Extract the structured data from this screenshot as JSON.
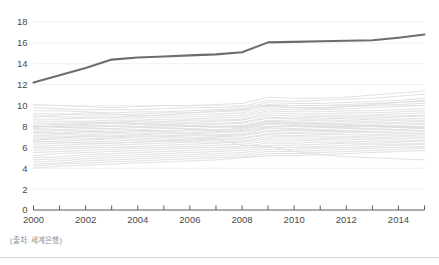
{
  "caption": {
    "source_text": "(출처: 세계은행)"
  },
  "colors": {
    "highlight_line": "#6d6d6d",
    "background_lines": "#dcdcdc",
    "gridline": "#f0f0f0",
    "axis": "#5a5a5a",
    "tick_text": "#4a4a4a",
    "caption_text": "#8a8a8a",
    "rule": "#d4d4d4",
    "page_background": "#ffffff"
  },
  "chart_data": {
    "type": "line",
    "title": "",
    "subtitle": "",
    "xlabel": "",
    "ylabel": "",
    "xlim": [
      2000,
      2015
    ],
    "ylim": [
      0,
      18
    ],
    "grid": true,
    "legend_position": "none",
    "x": [
      2000,
      2001,
      2002,
      2003,
      2004,
      2005,
      2006,
      2007,
      2008,
      2009,
      2010,
      2011,
      2012,
      2013,
      2014,
      2015
    ],
    "x_tick_labels": [
      "2000",
      "2002",
      "2004",
      "2006",
      "2008",
      "2010",
      "2012",
      "2014"
    ],
    "x_tick_values": [
      2000,
      2002,
      2004,
      2006,
      2008,
      2010,
      2012,
      2014
    ],
    "x_minor_tick_values": [
      2001,
      2003,
      2005,
      2007,
      2009,
      2011,
      2013,
      2015
    ],
    "y_tick_labels": [
      "0",
      "2",
      "4",
      "6",
      "8",
      "10",
      "12",
      "14",
      "16",
      "18"
    ],
    "y_tick_values": [
      0,
      2,
      4,
      6,
      8,
      10,
      12,
      14,
      16,
      18
    ],
    "series": [
      {
        "name": "highlighted",
        "emphasis": "high",
        "color": "#6d6d6d",
        "width": 2.1,
        "values": [
          12.2,
          12.9,
          13.6,
          14.4,
          14.6,
          14.7,
          14.8,
          14.9,
          15.1,
          16.05,
          16.1,
          16.15,
          16.2,
          16.25,
          16.5,
          16.8
        ]
      },
      {
        "name": "bg-01",
        "emphasis": "low",
        "values": [
          10.1,
          10.0,
          9.9,
          9.8,
          9.9,
          10.0,
          10.0,
          10.1,
          10.2,
          10.8,
          10.7,
          10.7,
          10.8,
          11.0,
          11.2,
          11.4
        ]
      },
      {
        "name": "bg-02",
        "emphasis": "low",
        "values": [
          9.8,
          9.7,
          9.6,
          9.6,
          9.6,
          9.7,
          9.8,
          9.8,
          9.9,
          10.5,
          10.4,
          10.5,
          10.6,
          10.7,
          10.9,
          11.1
        ]
      },
      {
        "name": "bg-03",
        "emphasis": "low",
        "values": [
          9.5,
          9.5,
          9.4,
          9.3,
          9.4,
          9.4,
          9.5,
          9.6,
          9.7,
          10.3,
          10.2,
          10.2,
          10.3,
          10.4,
          10.5,
          10.7
        ]
      },
      {
        "name": "bg-04",
        "emphasis": "low",
        "values": [
          9.2,
          9.2,
          9.1,
          9.1,
          9.2,
          9.3,
          9.3,
          9.4,
          9.5,
          10.1,
          10.0,
          10.0,
          10.1,
          10.2,
          10.3,
          10.4
        ]
      },
      {
        "name": "bg-05",
        "emphasis": "low",
        "values": [
          9.0,
          8.9,
          8.9,
          8.9,
          9.0,
          9.1,
          9.1,
          9.2,
          9.3,
          9.9,
          9.8,
          9.8,
          9.9,
          10.0,
          10.1,
          10.2
        ]
      },
      {
        "name": "bg-06",
        "emphasis": "low",
        "values": [
          8.7,
          8.7,
          8.8,
          8.8,
          8.8,
          8.9,
          8.9,
          9.0,
          9.1,
          9.7,
          9.6,
          9.6,
          9.7,
          9.8,
          9.9,
          10.0
        ]
      },
      {
        "name": "bg-07",
        "emphasis": "low",
        "values": [
          8.5,
          8.5,
          8.5,
          8.6,
          8.6,
          8.7,
          8.7,
          8.8,
          8.9,
          9.5,
          9.4,
          9.4,
          9.5,
          9.5,
          9.6,
          9.7
        ]
      },
      {
        "name": "bg-08",
        "emphasis": "low",
        "values": [
          8.3,
          8.3,
          8.4,
          8.4,
          8.5,
          8.5,
          8.6,
          8.6,
          8.7,
          9.3,
          9.2,
          9.2,
          9.3,
          9.3,
          9.4,
          9.5
        ]
      },
      {
        "name": "bg-09",
        "emphasis": "low",
        "values": [
          8.1,
          8.2,
          8.2,
          8.3,
          8.3,
          8.4,
          8.4,
          8.5,
          8.6,
          9.1,
          9.0,
          9.0,
          9.1,
          9.1,
          9.2,
          9.3
        ]
      },
      {
        "name": "bg-10",
        "emphasis": "low",
        "values": [
          8.0,
          8.0,
          8.1,
          8.1,
          8.2,
          8.2,
          8.3,
          8.3,
          8.4,
          8.9,
          8.8,
          8.9,
          8.9,
          9.0,
          9.0,
          9.1
        ]
      },
      {
        "name": "bg-11",
        "emphasis": "low",
        "values": [
          7.8,
          7.9,
          7.9,
          8.0,
          8.0,
          8.1,
          8.1,
          8.2,
          8.3,
          8.8,
          8.7,
          8.7,
          8.8,
          8.8,
          8.9,
          9.0
        ]
      },
      {
        "name": "bg-12",
        "emphasis": "low",
        "values": [
          7.7,
          7.7,
          7.8,
          7.8,
          7.9,
          7.9,
          8.0,
          8.0,
          8.1,
          8.6,
          8.5,
          8.6,
          8.6,
          8.7,
          8.7,
          8.8
        ]
      },
      {
        "name": "bg-13",
        "emphasis": "low",
        "values": [
          7.5,
          7.6,
          7.6,
          7.7,
          7.7,
          7.8,
          7.8,
          7.9,
          8.0,
          8.5,
          8.4,
          8.4,
          8.5,
          8.5,
          8.6,
          8.6
        ]
      },
      {
        "name": "bg-14",
        "emphasis": "low",
        "values": [
          7.4,
          7.4,
          7.5,
          7.5,
          7.6,
          7.6,
          7.7,
          7.7,
          7.8,
          8.3,
          8.2,
          8.3,
          8.3,
          8.4,
          8.4,
          8.5
        ]
      },
      {
        "name": "bg-15",
        "emphasis": "low",
        "values": [
          7.3,
          7.3,
          7.4,
          7.4,
          7.5,
          7.5,
          7.6,
          7.6,
          7.7,
          8.2,
          8.1,
          8.1,
          8.2,
          8.2,
          8.3,
          8.3
        ]
      },
      {
        "name": "bg-16",
        "emphasis": "low",
        "values": [
          7.1,
          7.2,
          7.2,
          7.3,
          7.3,
          7.4,
          7.4,
          7.5,
          7.6,
          8.0,
          8.0,
          8.0,
          8.0,
          8.1,
          8.1,
          8.2
        ]
      },
      {
        "name": "bg-17",
        "emphasis": "low",
        "values": [
          7.0,
          7.0,
          7.1,
          7.1,
          7.2,
          7.3,
          7.3,
          7.4,
          7.5,
          7.9,
          7.8,
          7.9,
          7.9,
          8.0,
          8.0,
          8.0
        ]
      },
      {
        "name": "bg-18",
        "emphasis": "low",
        "values": [
          6.8,
          6.9,
          7.0,
          7.0,
          7.1,
          7.1,
          7.2,
          7.2,
          7.3,
          7.8,
          7.7,
          7.7,
          7.8,
          7.8,
          7.9,
          7.9
        ]
      },
      {
        "name": "bg-19",
        "emphasis": "low",
        "values": [
          6.7,
          6.8,
          6.8,
          6.9,
          7.0,
          7.0,
          7.1,
          7.1,
          7.2,
          7.6,
          7.6,
          7.6,
          7.6,
          7.7,
          7.7,
          7.8
        ]
      },
      {
        "name": "bg-20",
        "emphasis": "low",
        "values": [
          6.5,
          6.6,
          6.7,
          6.8,
          6.8,
          6.9,
          6.9,
          7.0,
          7.1,
          7.5,
          7.4,
          7.5,
          7.5,
          7.5,
          7.6,
          7.6
        ]
      },
      {
        "name": "bg-21",
        "emphasis": "low",
        "values": [
          6.3,
          6.4,
          6.5,
          6.6,
          6.7,
          6.7,
          6.8,
          6.9,
          6.9,
          7.3,
          7.3,
          7.3,
          7.4,
          7.4,
          7.4,
          7.5
        ]
      },
      {
        "name": "bg-22",
        "emphasis": "low",
        "values": [
          6.1,
          6.2,
          6.3,
          6.4,
          6.5,
          6.6,
          6.6,
          6.7,
          6.8,
          7.2,
          7.1,
          7.2,
          7.2,
          7.2,
          7.3,
          7.3
        ]
      },
      {
        "name": "bg-23",
        "emphasis": "low",
        "values": [
          5.9,
          6.0,
          6.1,
          6.2,
          6.3,
          6.4,
          6.5,
          6.5,
          6.6,
          7.0,
          7.0,
          7.0,
          7.0,
          7.1,
          7.1,
          7.2
        ]
      },
      {
        "name": "bg-24",
        "emphasis": "low",
        "values": [
          5.7,
          5.8,
          5.9,
          6.0,
          6.1,
          6.2,
          6.3,
          6.4,
          6.5,
          6.8,
          6.8,
          6.8,
          6.9,
          6.9,
          7.0,
          7.0
        ]
      },
      {
        "name": "bg-25",
        "emphasis": "low",
        "values": [
          5.5,
          5.6,
          5.7,
          5.8,
          5.9,
          6.0,
          6.1,
          6.2,
          6.3,
          6.6,
          6.6,
          6.7,
          6.7,
          6.8,
          6.8,
          6.9
        ]
      },
      {
        "name": "bg-26",
        "emphasis": "low",
        "values": [
          5.2,
          5.4,
          5.5,
          5.6,
          5.7,
          5.8,
          5.9,
          6.0,
          6.1,
          6.4,
          6.4,
          6.5,
          6.5,
          6.6,
          6.6,
          6.7
        ]
      },
      {
        "name": "bg-27",
        "emphasis": "low",
        "values": [
          5.0,
          5.1,
          5.3,
          5.4,
          5.5,
          5.6,
          5.7,
          5.8,
          5.9,
          6.2,
          6.2,
          6.3,
          6.4,
          6.4,
          6.5,
          6.6
        ]
      },
      {
        "name": "bg-28",
        "emphasis": "low",
        "values": [
          4.8,
          4.9,
          5.1,
          5.2,
          5.3,
          5.4,
          5.5,
          5.6,
          5.7,
          6.0,
          6.0,
          6.1,
          6.2,
          6.3,
          6.3,
          6.4
        ]
      },
      {
        "name": "bg-29",
        "emphasis": "low",
        "values": [
          4.6,
          4.7,
          4.9,
          5.0,
          5.1,
          5.2,
          5.3,
          5.4,
          5.5,
          5.8,
          5.8,
          5.9,
          6.0,
          6.1,
          6.2,
          6.3
        ]
      },
      {
        "name": "bg-30",
        "emphasis": "low",
        "values": [
          4.4,
          4.5,
          4.7,
          4.8,
          4.9,
          5.0,
          5.1,
          5.2,
          5.3,
          5.6,
          5.6,
          5.7,
          5.8,
          5.9,
          6.0,
          6.1
        ]
      },
      {
        "name": "bg-31",
        "emphasis": "low",
        "values": [
          4.2,
          4.4,
          4.5,
          4.6,
          4.7,
          4.8,
          4.9,
          5.0,
          5.1,
          5.4,
          5.4,
          5.5,
          5.6,
          5.7,
          5.8,
          5.9
        ]
      },
      {
        "name": "bg-32",
        "emphasis": "low",
        "values": [
          4.0,
          4.2,
          4.3,
          4.4,
          4.5,
          4.6,
          4.7,
          4.8,
          5.0,
          5.2,
          5.2,
          5.3,
          5.4,
          5.5,
          5.6,
          5.7
        ]
      },
      {
        "name": "bg-33",
        "emphasis": "low",
        "values": [
          6.6,
          6.5,
          6.4,
          6.4,
          6.5,
          6.6,
          6.7,
          6.8,
          6.2,
          6.1,
          5.6,
          5.3,
          5.1,
          5.0,
          4.9,
          4.8
        ]
      },
      {
        "name": "bg-34",
        "emphasis": "low",
        "values": [
          7.9,
          8.1,
          8.3,
          8.4,
          8.3,
          8.2,
          8.1,
          8.0,
          7.9,
          8.4,
          8.3,
          8.2,
          8.1,
          8.0,
          7.9,
          7.8
        ]
      },
      {
        "name": "bg-35",
        "emphasis": "low",
        "values": [
          8.9,
          9.1,
          9.3,
          9.2,
          9.0,
          9.1,
          9.3,
          9.5,
          9.6,
          10.0,
          9.8,
          9.7,
          9.9,
          10.1,
          10.3,
          10.5
        ]
      }
    ]
  }
}
